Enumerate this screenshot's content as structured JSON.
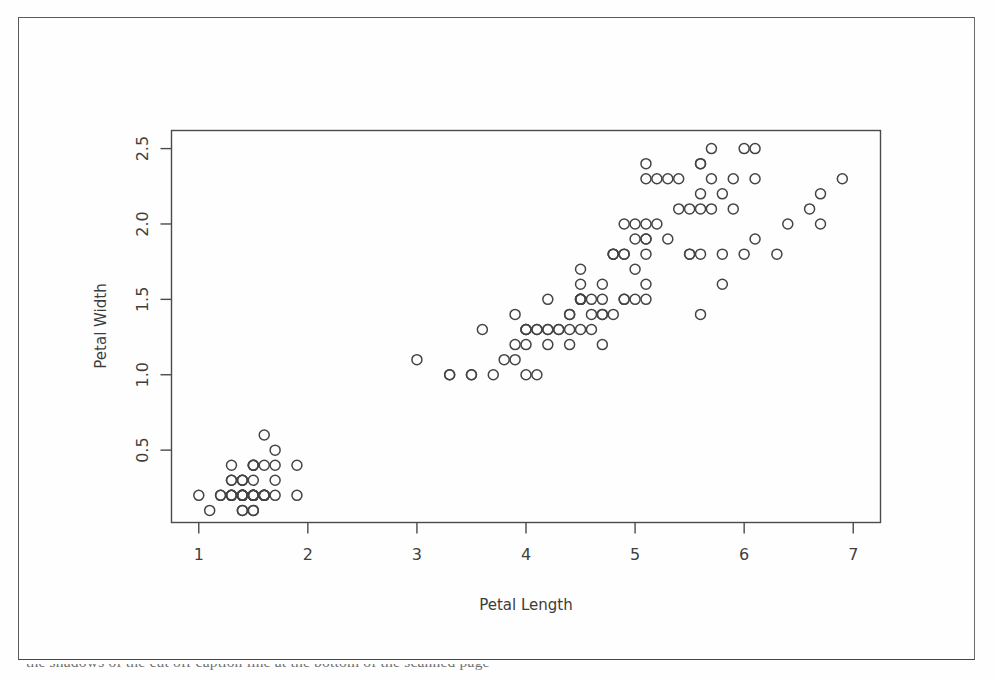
{
  "figure": {
    "background_color": "#fefefe",
    "border_color": "#5a5a5a",
    "marker_color": "#444444",
    "axis_color": "#4a4a4a"
  },
  "caption": {
    "text": "the shadows of the cut off caption line at the bottom of the scanned page"
  },
  "chart_data": {
    "type": "scatter",
    "title": "",
    "xlabel": "Petal Length",
    "ylabel": "Petal Width",
    "xlim": [
      0.75,
      7.25
    ],
    "ylim": [
      0.02,
      2.62
    ],
    "xticks": [
      1,
      2,
      3,
      4,
      5,
      6,
      7
    ],
    "xtick_labels": [
      "1",
      "2",
      "3",
      "4",
      "5",
      "6",
      "7"
    ],
    "yticks": [
      0.5,
      1.0,
      1.5,
      2.0,
      2.5
    ],
    "ytick_labels": [
      "0.5",
      "1.0",
      "1.5",
      "2.0",
      "2.5"
    ],
    "grid": false,
    "legend": null,
    "marker": "open-circle",
    "marker_size": 5,
    "n_points": 150,
    "series": [
      {
        "name": "iris",
        "x": [
          1.4,
          1.4,
          1.3,
          1.5,
          1.4,
          1.7,
          1.4,
          1.5,
          1.4,
          1.5,
          1.5,
          1.6,
          1.4,
          1.1,
          1.2,
          1.5,
          1.3,
          1.4,
          1.7,
          1.5,
          1.7,
          1.5,
          1.0,
          1.7,
          1.9,
          1.6,
          1.6,
          1.5,
          1.4,
          1.6,
          1.6,
          1.5,
          1.5,
          1.4,
          1.5,
          1.2,
          1.3,
          1.4,
          1.3,
          1.5,
          1.3,
          1.3,
          1.3,
          1.6,
          1.9,
          1.4,
          1.6,
          1.4,
          1.5,
          1.4,
          4.7,
          4.5,
          4.9,
          4.0,
          4.6,
          4.5,
          4.7,
          3.3,
          4.6,
          3.9,
          3.5,
          4.2,
          4.0,
          4.7,
          3.6,
          4.4,
          4.5,
          4.1,
          4.5,
          3.9,
          4.8,
          4.0,
          4.9,
          4.7,
          4.3,
          4.4,
          4.8,
          5.0,
          4.5,
          3.5,
          3.8,
          3.7,
          3.9,
          5.1,
          4.5,
          4.5,
          4.7,
          4.4,
          4.1,
          4.0,
          4.4,
          4.6,
          4.0,
          3.3,
          4.2,
          4.2,
          4.2,
          4.3,
          3.0,
          4.1,
          6.0,
          5.1,
          5.9,
          5.6,
          5.8,
          6.6,
          4.5,
          6.3,
          5.8,
          6.1,
          5.1,
          5.3,
          5.5,
          5.0,
          5.1,
          5.3,
          5.5,
          6.7,
          6.9,
          5.0,
          5.7,
          4.9,
          6.7,
          4.9,
          5.7,
          6.0,
          4.8,
          4.9,
          5.6,
          5.8,
          6.1,
          6.4,
          5.6,
          5.1,
          5.6,
          6.1,
          5.6,
          5.5,
          4.8,
          5.4,
          5.6,
          5.1,
          5.1,
          5.9,
          5.7,
          5.2,
          5.0,
          5.2,
          5.4,
          5.1
        ],
        "y": [
          0.2,
          0.2,
          0.2,
          0.2,
          0.2,
          0.4,
          0.3,
          0.2,
          0.2,
          0.1,
          0.2,
          0.2,
          0.1,
          0.1,
          0.2,
          0.4,
          0.4,
          0.3,
          0.3,
          0.3,
          0.2,
          0.4,
          0.2,
          0.5,
          0.2,
          0.2,
          0.4,
          0.2,
          0.2,
          0.2,
          0.2,
          0.4,
          0.1,
          0.2,
          0.2,
          0.2,
          0.2,
          0.1,
          0.2,
          0.2,
          0.3,
          0.3,
          0.2,
          0.6,
          0.4,
          0.3,
          0.2,
          0.2,
          0.2,
          0.2,
          1.4,
          1.5,
          1.5,
          1.3,
          1.5,
          1.3,
          1.6,
          1.0,
          1.3,
          1.4,
          1.0,
          1.5,
          1.0,
          1.4,
          1.3,
          1.4,
          1.5,
          1.0,
          1.5,
          1.1,
          1.8,
          1.3,
          1.5,
          1.2,
          1.3,
          1.4,
          1.4,
          1.7,
          1.5,
          1.0,
          1.1,
          1.0,
          1.2,
          1.6,
          1.5,
          1.6,
          1.5,
          1.3,
          1.3,
          1.3,
          1.2,
          1.4,
          1.2,
          1.0,
          1.3,
          1.2,
          1.3,
          1.3,
          1.1,
          1.3,
          2.5,
          1.9,
          2.1,
          1.8,
          2.2,
          2.1,
          1.7,
          1.8,
          1.8,
          2.5,
          2.0,
          1.9,
          2.1,
          2.0,
          2.4,
          2.3,
          1.8,
          2.2,
          2.3,
          1.5,
          2.3,
          2.0,
          2.0,
          1.8,
          2.1,
          1.8,
          1.8,
          1.8,
          2.1,
          1.6,
          1.9,
          2.0,
          2.2,
          1.5,
          1.4,
          2.3,
          2.4,
          1.8,
          1.8,
          2.1,
          2.4,
          2.3,
          1.9,
          2.3,
          2.5,
          2.3,
          1.9,
          2.0,
          2.3,
          1.8
        ]
      }
    ]
  }
}
